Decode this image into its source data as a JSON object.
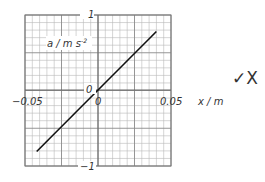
{
  "chart_data": {
    "type": "line",
    "title": "",
    "xlabel": "x / m",
    "ylabel": "a / m s⁻²",
    "xlim": [
      -0.05,
      0.05
    ],
    "ylim": [
      -1,
      1
    ],
    "x_tick_labels": [
      "-0.05",
      "0",
      "0.05"
    ],
    "y_tick_labels": [
      "1",
      "0",
      "-1"
    ],
    "grid": true,
    "series": [
      {
        "name": "a vs x",
        "x": [
          -0.042,
          0.0,
          0.04
        ],
        "y": [
          -0.82,
          0.0,
          0.78
        ]
      }
    ]
  },
  "labels": {
    "y_axis": "a / m s",
    "y_axis_exp": "-2",
    "x_axis": "x / m",
    "y_top": "1",
    "y_zero": "0",
    "y_bottom": "−1",
    "x_left": "−0.05",
    "x_zero": "0",
    "x_right": "0.05"
  },
  "annotation": {
    "marks": "✓X"
  }
}
